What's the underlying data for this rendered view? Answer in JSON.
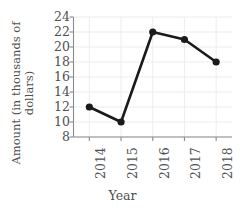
{
  "chart_data": {
    "type": "line",
    "title": "",
    "xlabel": "Year",
    "ylabel": "Amount (in thousands of dollars)",
    "ylabel_line1": "Amount (in thousands of",
    "ylabel_line2": "dollars)",
    "categories": [
      "2014",
      "2015",
      "2016",
      "2017",
      "2018"
    ],
    "values": [
      12,
      10,
      22,
      21,
      18
    ],
    "series": [
      {
        "name": "Amount",
        "values": [
          12,
          10,
          22,
          21,
          18
        ],
        "color": "#1a1a1a",
        "marker": "circle"
      }
    ],
    "points": [
      {
        "x": "2014",
        "y": 12
      },
      {
        "x": "2015",
        "y": 10
      },
      {
        "x": "2016",
        "y": 22
      },
      {
        "x": "2017",
        "y": 21
      },
      {
        "x": "2018",
        "y": 18
      }
    ],
    "ylim": [
      8,
      24
    ],
    "yticks": [
      24,
      22,
      20,
      18,
      16,
      14,
      12,
      10,
      8
    ],
    "xticks": [
      "2014",
      "2015",
      "2016",
      "2017",
      "2018"
    ],
    "grid": true,
    "legend": false,
    "colors": {
      "line": "#1a1a1a",
      "marker": "#1a1a1a",
      "axis": "#8a8a8a",
      "grid": "#ededed",
      "text": "#4f4f4f",
      "background": "#ffffff"
    }
  }
}
